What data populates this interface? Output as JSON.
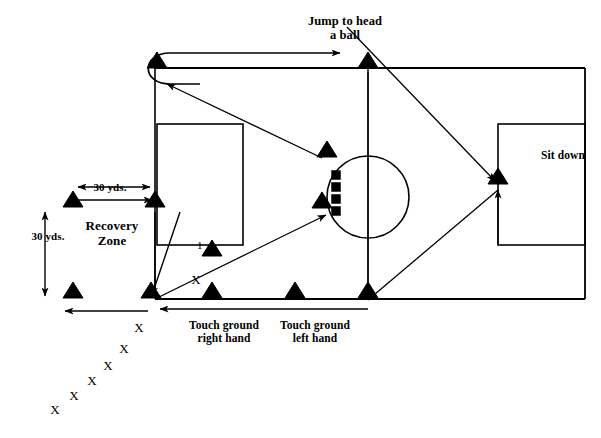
{
  "diagram": {
    "background_color": "#ffffff",
    "ink_color": "#000000",
    "width": 601,
    "height": 438,
    "labels": {
      "jump_to_head": "Jump to head\na ball",
      "sit_down": "Sit down",
      "recovery_zone": "Recovery\nZone",
      "touch_ground_right": "Touch ground\nright hand",
      "touch_ground_left": "Touch ground\nleft hand",
      "distance_horizontal": "30 yds.",
      "distance_vertical": "30 yds.",
      "station_number": "1",
      "x_marker": "X"
    },
    "field": {
      "top_line_y": 68,
      "bottom_line_y": 299,
      "left_x": 155,
      "right_x": 585,
      "left_penalty_box": {
        "x": 157,
        "y": 124,
        "w": 86,
        "h": 121
      },
      "right_penalty_box": {
        "x": 498,
        "y": 124,
        "w": 87,
        "h": 121
      },
      "center_circle": {
        "cx": 368,
        "cy": 197,
        "r": 41
      },
      "halfway_line_x": 368
    },
    "cones": [
      {
        "name": "cone-top-left",
        "x": 157,
        "y": 68
      },
      {
        "name": "cone-top-center",
        "x": 368,
        "y": 68
      },
      {
        "name": "cone-recovery-upper-left",
        "x": 73,
        "y": 207
      },
      {
        "name": "cone-recovery-upper-right",
        "x": 155,
        "y": 207
      },
      {
        "name": "cone-circle-upper",
        "x": 327,
        "y": 157
      },
      {
        "name": "cone-circle-lower",
        "x": 322,
        "y": 208
      },
      {
        "name": "cone-sit-down",
        "x": 498,
        "y": 184
      },
      {
        "name": "cone-station-one",
        "x": 212,
        "y": 256
      },
      {
        "name": "cone-recovery-lower-left",
        "x": 73,
        "y": 298
      },
      {
        "name": "cone-bottom-left",
        "x": 151,
        "y": 298
      },
      {
        "name": "cone-bottom-second",
        "x": 212,
        "y": 298
      },
      {
        "name": "cone-bottom-third",
        "x": 295,
        "y": 298
      },
      {
        "name": "cone-bottom-center",
        "x": 368,
        "y": 298
      }
    ],
    "hurdles": [
      {
        "x": 336,
        "y": 175
      },
      {
        "x": 336,
        "y": 187
      },
      {
        "x": 336,
        "y": 199
      },
      {
        "x": 336,
        "y": 211
      }
    ],
    "x_markers": [
      {
        "x": 196,
        "y": 279
      },
      {
        "x": 139,
        "y": 327
      },
      {
        "x": 124,
        "y": 348
      },
      {
        "x": 108,
        "y": 365
      },
      {
        "x": 92,
        "y": 380
      },
      {
        "x": 74,
        "y": 395
      },
      {
        "x": 55,
        "y": 409
      }
    ]
  }
}
